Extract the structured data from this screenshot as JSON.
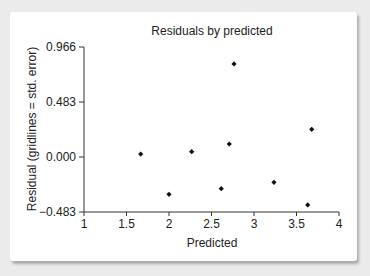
{
  "chart_data": {
    "type": "scatter",
    "title": "Residuals by predicted",
    "xlabel": "Predicted",
    "ylabel": "Residual (gridlines = std. error)",
    "xlim": [
      1,
      4
    ],
    "ylim": [
      -0.483,
      0.966
    ],
    "x_ticks": [
      1,
      1.5,
      2,
      2.5,
      3,
      3.5,
      4
    ],
    "x_tick_labels": [
      "1",
      "1.5",
      "2",
      "2.5",
      "3",
      "3.5",
      "4"
    ],
    "y_ticks": [
      -0.483,
      0.0,
      0.483,
      0.966
    ],
    "y_tick_labels": [
      "−0.483",
      "0.000",
      "0.483",
      "0.966"
    ],
    "grid": false,
    "legend": null,
    "points": [
      {
        "x": 1.667,
        "y": 0.026
      },
      {
        "x": 2.0,
        "y": -0.328
      },
      {
        "x": 2.267,
        "y": 0.047
      },
      {
        "x": 2.615,
        "y": -0.278
      },
      {
        "x": 2.709,
        "y": 0.114
      },
      {
        "x": 2.765,
        "y": 0.817
      },
      {
        "x": 3.235,
        "y": -0.222
      },
      {
        "x": 3.632,
        "y": -0.421
      },
      {
        "x": 3.679,
        "y": 0.243
      }
    ],
    "marker": "diamond",
    "marker_color": "#111111"
  }
}
